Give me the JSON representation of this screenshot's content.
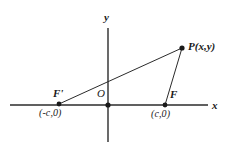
{
  "figure": {
    "background_color": "#ffffff",
    "stroke_color": "#2b2b2b",
    "axes": {
      "x_label": "x",
      "y_label": "y",
      "origin_label": "O"
    },
    "points": [
      {
        "id": "F-prime",
        "label": "F'",
        "coordinate_label": "(-c,0)",
        "px": 59,
        "py": 104
      },
      {
        "id": "O",
        "label": "O",
        "coordinate_label": "",
        "px": 108,
        "py": 105
      },
      {
        "id": "F",
        "label": "F",
        "coordinate_label": "(c,0)",
        "px": 165,
        "py": 105
      },
      {
        "id": "P",
        "label": "P(x,y)",
        "coordinate_label": "",
        "px": 182,
        "py": 48
      }
    ],
    "segments": [
      {
        "id": "F-prime-to-P",
        "from": "F-prime",
        "to": "P"
      },
      {
        "id": "F-to-P",
        "from": "F",
        "to": "P"
      }
    ]
  }
}
